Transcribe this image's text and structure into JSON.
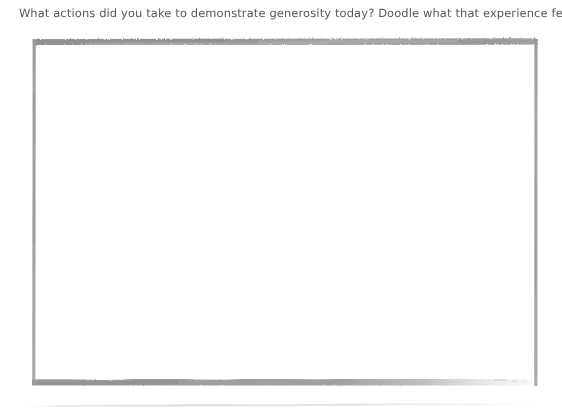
{
  "page": {
    "background_color": "#ffffff",
    "width": 562,
    "height": 417
  },
  "prompt": {
    "text": "What actions did you take to demonstrate generosity today? Doodle what that experience felt like.",
    "color": "#4a4a4a",
    "style": "handwriting"
  },
  "doodle_area": {
    "label": "",
    "placeholder": "",
    "border_color": "#9b9b9b",
    "fill_color": "#ffffff",
    "border_style": "brush-stroke-rectangle"
  },
  "baseline_rule": {
    "color": "#d8d8d8"
  }
}
